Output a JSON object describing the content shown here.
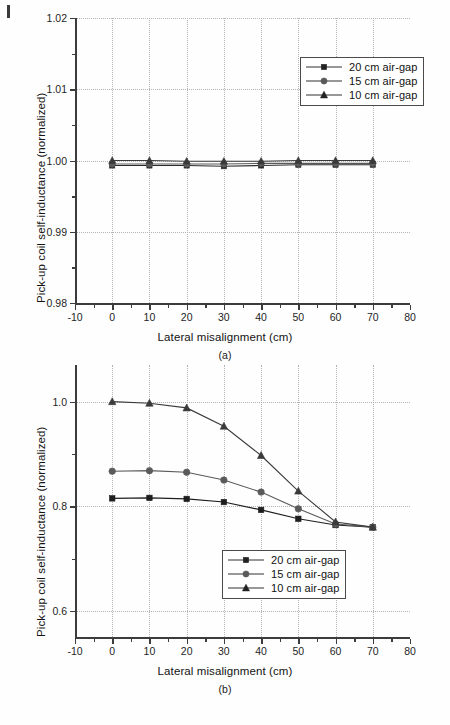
{
  "figure": {
    "panels": [
      {
        "caption": "(a)",
        "xlabel": "Lateral misalignment (cm)",
        "ylabel": "Pick-up coil self-inductance (normalized)",
        "xticks": [
          "-10",
          "0",
          "10",
          "20",
          "30",
          "40",
          "50",
          "60",
          "70",
          "80"
        ],
        "yticks": [
          "0.98",
          "0.99",
          "1.00",
          "1.01",
          "1.02"
        ]
      },
      {
        "caption": "(b)",
        "xlabel": "Lateral misalignment (cm)",
        "ylabel": "Pick-up coil self-inductance (normalized)",
        "xticks": [
          "-10",
          "0",
          "10",
          "20",
          "30",
          "40",
          "50",
          "60",
          "70",
          "80"
        ],
        "yticks": [
          "0.6",
          "0.8",
          "1.0"
        ]
      }
    ],
    "legend": [
      {
        "label": "20 cm air-gap",
        "marker": "square-marker"
      },
      {
        "label": "15 cm air-gap",
        "marker": "circle-marker"
      },
      {
        "label": "10 cm air-gap",
        "marker": "triangle-marker"
      }
    ]
  },
  "chart_data": [
    {
      "type": "line",
      "panel": "(a)",
      "title": "",
      "xlabel": "Lateral misalignment (cm)",
      "ylabel": "Pick-up coil self-inductance (normalized)",
      "x": [
        0,
        10,
        20,
        30,
        40,
        50,
        60,
        70
      ],
      "xlim": [
        -10,
        80
      ],
      "ylim": [
        0.98,
        1.02
      ],
      "xticks": [
        -10,
        0,
        10,
        20,
        30,
        40,
        50,
        60,
        70,
        80
      ],
      "yticks": [
        0.98,
        0.99,
        1.0,
        1.01,
        1.02
      ],
      "grid": true,
      "legend_position": "upper-right",
      "series": [
        {
          "name": "20 cm air-gap",
          "marker": "square",
          "color": "#2a2a2a",
          "values": [
            0.9993,
            0.9993,
            0.9993,
            0.9992,
            0.9993,
            0.9994,
            0.9994,
            0.9994
          ]
        },
        {
          "name": "15 cm air-gap",
          "marker": "circle",
          "color": "#5a5a5a",
          "values": [
            0.9995,
            0.9995,
            0.9995,
            0.9995,
            0.9996,
            0.9996,
            0.9996,
            0.9996
          ]
        },
        {
          "name": "10 cm air-gap",
          "marker": "triangle",
          "color": "#3a3a3a",
          "values": [
            1.0,
            1.0,
            0.9999,
            0.9999,
            0.9999,
            1.0,
            1.0,
            1.0
          ]
        }
      ]
    },
    {
      "type": "line",
      "panel": "(b)",
      "title": "",
      "xlabel": "Lateral misalignment (cm)",
      "ylabel": "Pick-up coil self-inductance (normalized)",
      "x": [
        0,
        10,
        20,
        30,
        40,
        50,
        60,
        70
      ],
      "xlim": [
        -10,
        80
      ],
      "ylim": [
        0.55,
        1.07
      ],
      "xticks": [
        -10,
        0,
        10,
        20,
        30,
        40,
        50,
        60,
        70,
        80
      ],
      "yticks": [
        0.6,
        0.8,
        1.0
      ],
      "grid": true,
      "legend_position": "lower-right",
      "series": [
        {
          "name": "20 cm air-gap",
          "marker": "square",
          "color": "#1e1e1e",
          "values": [
            0.815,
            0.816,
            0.814,
            0.808,
            0.793,
            0.776,
            0.764,
            0.76
          ]
        },
        {
          "name": "15 cm air-gap",
          "marker": "circle",
          "color": "#5a5a5a",
          "values": [
            0.867,
            0.868,
            0.865,
            0.85,
            0.827,
            0.795,
            0.766,
            0.76
          ]
        },
        {
          "name": "10 cm air-gap",
          "marker": "triangle",
          "color": "#3a3a3a",
          "values": [
            1.0,
            0.997,
            0.988,
            0.953,
            0.897,
            0.829,
            0.77,
            0.76
          ]
        }
      ]
    }
  ]
}
